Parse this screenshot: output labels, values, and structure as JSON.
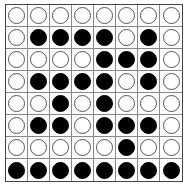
{
  "board": {
    "rows": 8,
    "cols": 8,
    "colors": {
      "black": "#000000",
      "white": "#ffffff",
      "grid_line": "#888888"
    },
    "cells": [
      [
        "W",
        "W",
        "W",
        "W",
        "W",
        "W",
        "W",
        "W"
      ],
      [
        "W",
        "B",
        "B",
        "B",
        "B",
        "W",
        "B",
        "W"
      ],
      [
        "W",
        "W",
        "W",
        "W",
        "B",
        "B",
        "B",
        "W"
      ],
      [
        "W",
        "B",
        "B",
        "B",
        "B",
        "W",
        "B",
        "W"
      ],
      [
        "W",
        "W",
        "B",
        "W",
        "B",
        "W",
        "W",
        "W"
      ],
      [
        "W",
        "B",
        "B",
        "W",
        "B",
        "B",
        "B",
        "W"
      ],
      [
        "W",
        "W",
        "W",
        "W",
        "W",
        "B",
        "W",
        "W"
      ],
      [
        "B",
        "B",
        "B",
        "B",
        "B",
        "B",
        "B",
        "B"
      ]
    ]
  }
}
